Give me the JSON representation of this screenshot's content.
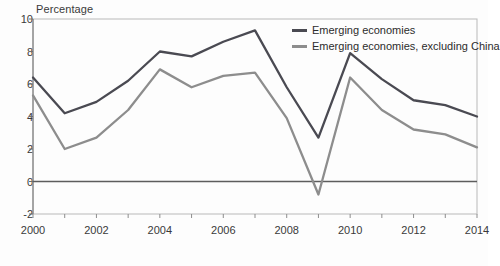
{
  "chart_data": {
    "type": "line",
    "title": "",
    "subtitle": "",
    "ylabel": "Percentage",
    "xlabel": "",
    "ylim": [
      -2,
      10
    ],
    "xlim": [
      2000,
      2014
    ],
    "grid": false,
    "legend_position": "top-right",
    "y_ticks": [
      "10",
      "8",
      "6",
      "4",
      "2",
      "0",
      "-2"
    ],
    "y_tick_values": [
      10,
      8,
      6,
      4,
      2,
      0,
      -2
    ],
    "x_ticks": [
      "2000",
      "2002",
      "2004",
      "2006",
      "2008",
      "2010",
      "2012",
      "2014"
    ],
    "x_tick_values": [
      2000,
      2002,
      2004,
      2006,
      2008,
      2010,
      2012,
      2014
    ],
    "x": [
      2000,
      2001,
      2002,
      2003,
      2004,
      2005,
      2006,
      2007,
      2008,
      2009,
      2010,
      2011,
      2012,
      2013,
      2014
    ],
    "series": [
      {
        "name": "Emerging economies",
        "color": "#4a4a52",
        "values": [
          6.4,
          4.2,
          4.9,
          6.2,
          8.0,
          7.7,
          8.6,
          9.3,
          5.8,
          2.7,
          7.9,
          6.3,
          5.0,
          4.7,
          4.0
        ]
      },
      {
        "name": "Emerging economies, excluding China",
        "color": "#8d8d8d",
        "values": [
          5.3,
          2.0,
          2.7,
          4.4,
          6.9,
          5.8,
          6.5,
          6.7,
          3.9,
          -0.8,
          6.4,
          4.4,
          3.2,
          2.9,
          2.1
        ]
      }
    ],
    "zero_line": 0,
    "zero_line_color": "#5d5d5d"
  },
  "legend": {
    "items": [
      {
        "label": "Emerging economies"
      },
      {
        "label": "Emerging economies, excluding China"
      }
    ]
  },
  "axes": {
    "y_title": "Percentage"
  }
}
